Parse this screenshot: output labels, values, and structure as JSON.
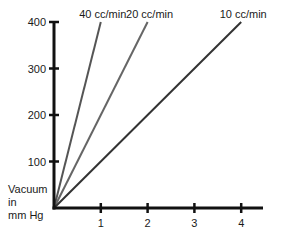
{
  "chart_data": {
    "type": "line",
    "title": "",
    "xlabel": "",
    "ylabel": "Vacuum in mm Hg",
    "ylabel_lines": [
      "Vacuum",
      "in",
      "mm Hg"
    ],
    "xlim": [
      0,
      4.5
    ],
    "ylim": [
      0,
      400
    ],
    "x_ticks": [
      1,
      2,
      3,
      4
    ],
    "y_ticks": [
      100,
      200,
      300,
      400
    ],
    "grid": false,
    "legend": "inline labels at line ends",
    "series": [
      {
        "name": "40 cc/min",
        "x": [
          0,
          1
        ],
        "y": [
          0,
          400
        ],
        "color": "#555555"
      },
      {
        "name": "20 cc/min",
        "x": [
          0,
          2
        ],
        "y": [
          0,
          400
        ],
        "color": "#666666"
      },
      {
        "name": "10 cc/min",
        "x": [
          0,
          4
        ],
        "y": [
          0,
          400
        ],
        "color": "#333333"
      }
    ]
  }
}
